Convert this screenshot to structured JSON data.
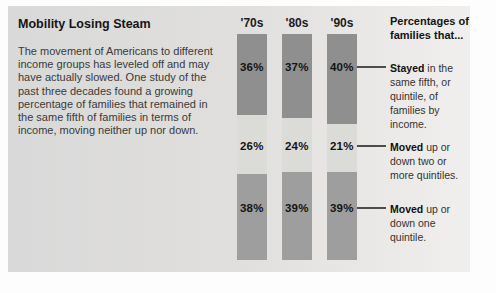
{
  "panel": {
    "title": "Mobility Losing Steam",
    "description": "The movement of Americans to different income groups has leveled off and may have actually slowed. One study of the past three decades found a growing percentage of families that remained in the same fifth of families in terms of income, moving neither up nor down."
  },
  "chart_data": {
    "type": "bar",
    "stacked": true,
    "unit": "%",
    "categories": [
      "'70s",
      "'80s",
      "'90s"
    ],
    "series": [
      {
        "key": "stayed",
        "name": "Stayed in the same fifth, or quintile, of families by income.",
        "color": "#8f8f8f",
        "values": [
          36,
          37,
          40
        ]
      },
      {
        "key": "moved-two-or-more-quintiles",
        "name": "Moved up or down two or more quintiles.",
        "color": "#dbdbd7",
        "values": [
          26,
          24,
          21
        ]
      },
      {
        "key": "moved-one-quintile",
        "name": "Moved up or down one quintile.",
        "color": "#9e9e9e",
        "values": [
          38,
          39,
          39
        ]
      }
    ],
    "ylim": [
      0,
      100
    ],
    "grid": false,
    "value_labels": "inside",
    "legend_position": "right"
  },
  "legend": {
    "header": "Percentages of families that...",
    "entries": [
      {
        "lead": "Stayed",
        "rest": " in the same fifth, or quintile, of families by income."
      },
      {
        "lead": "Moved",
        "rest": " up or down two or more quintiles."
      },
      {
        "lead": "Moved",
        "rest": " up or down one quintile."
      }
    ]
  },
  "colors": {
    "panel_bg_left": "#d9d9d9",
    "panel_bg_right": "#f0efed",
    "connector": "#4d4d4d",
    "text": "#333333"
  }
}
